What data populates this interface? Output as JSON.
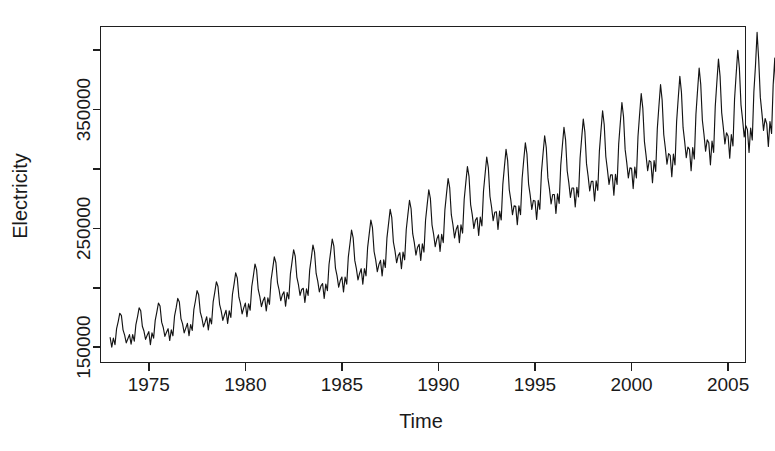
{
  "figure": {
    "background_color": "#ffffff",
    "foreground_color": "#1a1a1a",
    "line_color": "#141414"
  },
  "chart_data": {
    "type": "line",
    "title": "",
    "subtitle": "",
    "xlabel": "Time",
    "ylabel": "Electricity",
    "grid": false,
    "legend": false,
    "legend_position": "none",
    "xlim": [
      1972.5,
      2005.9
    ],
    "ylim": [
      137000,
      420000
    ],
    "x_ticks": [
      1975,
      1980,
      1985,
      1990,
      1995,
      2000,
      2005
    ],
    "x_tick_labels": [
      "1975",
      "1980",
      "1985",
      "1990",
      "1995",
      "2000",
      "2005"
    ],
    "x_minor_ticks": [
      1972.5,
      1977.5,
      1982.5,
      1987.5,
      1992.5,
      1997.5,
      2002.5
    ],
    "y_ticks": [
      150000,
      200000,
      250000,
      300000,
      350000,
      400000
    ],
    "y_tick_labels": [
      "150000",
      "",
      "250000",
      "",
      "350000",
      ""
    ],
    "y_labeled_ticks": [
      150000,
      250000,
      350000
    ],
    "x_start": 1973.0,
    "x_step": 0.0833333,
    "series": [
      {
        "name": "Electricity",
        "color": "#141414",
        "values": [
          158000,
          150000,
          157500,
          152000,
          165500,
          171500,
          178500,
          176500,
          164500,
          160000,
          153500,
          157000,
          160500,
          152500,
          160500,
          155000,
          169000,
          175500,
          183000,
          180500,
          167500,
          163500,
          156500,
          160000,
          163000,
          152000,
          162000,
          157500,
          172500,
          179500,
          187000,
          184500,
          171000,
          166500,
          159000,
          162500,
          165500,
          155500,
          164500,
          159500,
          176000,
          183000,
          191000,
          188000,
          174000,
          169500,
          162000,
          166000,
          170000,
          159500,
          169000,
          164000,
          181500,
          189000,
          197500,
          194000,
          179500,
          174500,
          167000,
          171000,
          175500,
          164500,
          174500,
          169500,
          188000,
          196000,
          205000,
          201000,
          186000,
          180500,
          172500,
          177000,
          181000,
          170000,
          180500,
          175000,
          194500,
          203000,
          212500,
          208000,
          192000,
          186500,
          178000,
          183000,
          187000,
          175500,
          186500,
          181000,
          201000,
          210000,
          220000,
          215000,
          198500,
          192500,
          184000,
          189000,
          192000,
          180500,
          191500,
          186000,
          206500,
          216000,
          226000,
          221000,
          204000,
          198000,
          189000,
          194000,
          196500,
          184500,
          196000,
          190500,
          211500,
          221500,
          232000,
          226500,
          209000,
          202500,
          193500,
          198500,
          199500,
          187500,
          199000,
          193500,
          215000,
          225000,
          236000,
          230000,
          212000,
          205500,
          196500,
          201500,
          203500,
          191000,
          203000,
          197500,
          219500,
          230000,
          241000,
          235000,
          216500,
          210000,
          200500,
          206000,
          209000,
          196500,
          209000,
          203000,
          226000,
          237000,
          248500,
          242000,
          223000,
          216000,
          206500,
          212000,
          216000,
          203000,
          216000,
          210000,
          234000,
          245500,
          257000,
          250500,
          230500,
          223500,
          213500,
          219500,
          223000,
          210000,
          223500,
          217000,
          242000,
          254000,
          266000,
          259000,
          238500,
          231000,
          221000,
          227000,
          229500,
          216000,
          230000,
          223500,
          249000,
          261500,
          273500,
          266500,
          245500,
          238000,
          227500,
          234000,
          236500,
          223000,
          237000,
          230000,
          257000,
          270000,
          282500,
          275000,
          253000,
          245000,
          234500,
          241000,
          244500,
          230500,
          245000,
          238000,
          265500,
          279000,
          292000,
          284000,
          261500,
          253000,
          242000,
          249000,
          252500,
          238000,
          253000,
          246000,
          274500,
          288500,
          302000,
          293500,
          270000,
          261500,
          250000,
          257000,
          259000,
          244000,
          259500,
          252000,
          281500,
          296000,
          310000,
          301000,
          277000,
          268000,
          256500,
          263500,
          264000,
          249000,
          264500,
          257000,
          287000,
          302000,
          316500,
          307000,
          282500,
          273500,
          261500,
          269000,
          268500,
          253000,
          269000,
          261500,
          292000,
          307500,
          322000,
          312500,
          287500,
          278000,
          266000,
          273500,
          273000,
          257500,
          273500,
          266000,
          297000,
          313000,
          328000,
          318000,
          292500,
          283000,
          270500,
          278500,
          278500,
          262500,
          279000,
          271000,
          303000,
          319500,
          335000,
          324500,
          298500,
          288500,
          276000,
          284000,
          284000,
          268000,
          284500,
          276500,
          309000,
          326000,
          342000,
          331000,
          304500,
          294000,
          281500,
          289500,
          289500,
          273000,
          290000,
          282000,
          315000,
          332500,
          349000,
          337500,
          310500,
          299500,
          287000,
          295000,
          295000,
          278000,
          295500,
          287000,
          321000,
          339000,
          356000,
          344000,
          316500,
          305500,
          292500,
          301000,
          300500,
          283500,
          301500,
          292500,
          327500,
          346000,
          363500,
          351000,
          323000,
          311500,
          298500,
          307000,
          306000,
          288500,
          307000,
          298000,
          334000,
          353000,
          371000,
          358000,
          329000,
          317500,
          304000,
          313000,
          311500,
          293500,
          312500,
          303500,
          340000,
          359500,
          378000,
          364500,
          335000,
          323000,
          309500,
          318500,
          316500,
          298500,
          318000,
          308500,
          346000,
          366000,
          385000,
          371000,
          341000,
          329000,
          315000,
          324500,
          322000,
          303500,
          323500,
          314000,
          352500,
          373000,
          392500,
          378000,
          347500,
          335000,
          321000,
          330500,
          327500,
          309000,
          329000,
          319500,
          359000,
          380000,
          400000,
          385000,
          354000,
          341500,
          327000,
          336500,
          333000,
          314000,
          334500,
          324500,
          365000,
          387000,
          415000,
          392000,
          360500,
          347000,
          332500,
          342500,
          338000,
          319000,
          340000,
          330000,
          371000,
          393500,
          348000
        ]
      }
    ]
  },
  "axis": {
    "x_title": "Time",
    "y_title": "Electricity"
  }
}
